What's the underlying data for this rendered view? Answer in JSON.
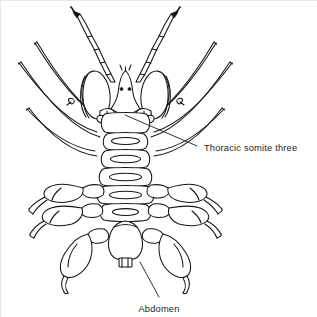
{
  "figure": {
    "background_color": "#ffffff",
    "ink_color": "#141414",
    "view": "dorsal",
    "symmetry": "bilateral",
    "width": 317,
    "height": 317
  },
  "callouts": [
    {
      "id": "thoracic-somite-three",
      "label": "Thoracic somite three",
      "text_x": 203,
      "text_y": 148,
      "leader_from_x": 196,
      "leader_from_y": 145,
      "leader_to_x": 124,
      "leader_to_y": 114
    },
    {
      "id": "abdomen",
      "label": "Abdomen",
      "text_x": 137,
      "text_y": 309,
      "leader_from_x": 158,
      "leader_from_y": 296,
      "leader_to_x": 139,
      "leader_to_y": 261
    }
  ],
  "anatomy": {
    "head": {
      "name": "cephalon",
      "eye_count": 2,
      "eye_left_x": 120,
      "eye_right_x": 129,
      "eye_y": 88
    },
    "antennae": {
      "name": "chelate antennae",
      "count": 2,
      "segments_per_antenna": 4,
      "tip_style": "dark-chela"
    },
    "palps": {
      "name": "oval palps",
      "count": 2
    },
    "slender_legs": {
      "name": "slender curved pereopods",
      "pairs": 3
    },
    "clawed_legs": {
      "name": "clawed pereopods",
      "pairs": 3,
      "tip_style": "hooked-dactyl"
    },
    "trunk": {
      "name": "thoracic somites",
      "somite_count": 6
    },
    "abdomen": {
      "name": "abdomen",
      "shape": "small rectangular terminal segment"
    }
  }
}
